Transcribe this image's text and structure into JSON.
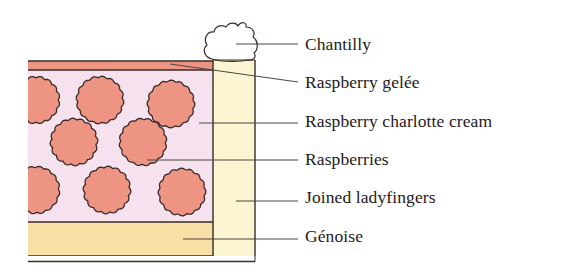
{
  "diagram": {
    "type": "cross-section",
    "colors": {
      "outline": "#3a2a28",
      "leader_line": "#4a4444",
      "chantilly": "#ffffff",
      "gelee": "#ee9483",
      "cream": "#f5e2ee",
      "raspberry": "#ee9483",
      "ladyfingers": "#fbf5d2",
      "genoise": "#f8dfa6"
    },
    "labels": [
      {
        "id": "chantilly",
        "text": "Chantilly",
        "top": 36
      },
      {
        "id": "raspberry-gelee",
        "text": "Raspberry gelée",
        "top": 74
      },
      {
        "id": "raspberry-charlotte-cream",
        "text": "Raspberry charlotte cream",
        "top": 113
      },
      {
        "id": "raspberries",
        "text": "Raspberries",
        "top": 151
      },
      {
        "id": "joined-ladyfingers",
        "text": "Joined ladyfingers",
        "top": 189
      },
      {
        "id": "genoise",
        "text": "Génoise",
        "top": 228
      }
    ]
  }
}
